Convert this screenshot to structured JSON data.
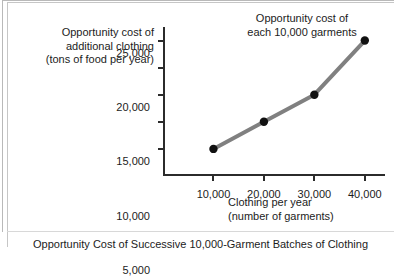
{
  "figure": {
    "caption": "Opportunity Cost of Successive 10,000-Garment Batches of Clothing",
    "axis_title_y_line1": "Opportunity cost of",
    "axis_title_y_line2": "additional clothing",
    "axis_title_y_line3": "(tons of food per year)",
    "axis_title_x_line1": "Clothing per year",
    "axis_title_x_line2": "(number of garments)",
    "callout_line1": "Opportunity cost of",
    "callout_line2": "each 10,000 garments",
    "line_color": "#808080",
    "marker_color": "#111111",
    "axis_color": "#2b2b2b"
  },
  "chart_data": {
    "type": "line",
    "title": "Opportunity Cost of Successive 10,000-Garment Batches of Clothing",
    "xlabel": "Clothing per year (number of garments)",
    "ylabel": "Opportunity cost of additional clothing (tons of food per year)",
    "x": [
      10000,
      20000,
      30000,
      40000
    ],
    "values": [
      5000,
      10000,
      15000,
      25000
    ],
    "series": [
      {
        "name": "Opportunity cost of each 10,000 garments",
        "x": [
          10000,
          20000,
          30000,
          40000
        ],
        "values": [
          5000,
          10000,
          15000,
          25000
        ]
      }
    ],
    "xlim": [
      0,
      44000
    ],
    "ylim": [
      0,
      27500
    ],
    "xtick_values": [
      0,
      10000,
      20000,
      30000,
      40000
    ],
    "xtick_labels": [
      "0",
      "10,000",
      "20,000",
      "30,000",
      "40,000"
    ],
    "ytick_values": [
      5000,
      10000,
      15000,
      20000,
      25000
    ],
    "ytick_labels": [
      "5,000",
      "10,000",
      "15,000",
      "20,000",
      "25,000"
    ],
    "grid": false,
    "legend": "none",
    "markers": "filled-circle",
    "annotations": [
      {
        "text": "Opportunity cost of each 10,000 garments",
        "points_to": [
          40000,
          25000
        ]
      }
    ]
  }
}
